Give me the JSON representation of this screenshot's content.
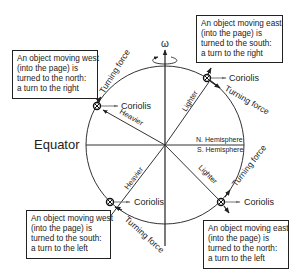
{
  "diagram": {
    "axis_label": "ω",
    "equator_label": "Equator",
    "hemisphere_labels": {
      "north": "N. Hemisphere",
      "south": "S. Hemisphere"
    },
    "markers": [
      {
        "id": "upper-left",
        "coriolis": "Coriolis",
        "turning": "Turning force",
        "radial": "Heavier"
      },
      {
        "id": "upper-right",
        "coriolis": "Coriolis",
        "turning": "Turning force",
        "radial": "Lighter"
      },
      {
        "id": "lower-left",
        "coriolis": "Coriolis",
        "turning": "Turning force",
        "radial": "Heavier"
      },
      {
        "id": "lower-right",
        "coriolis": "Coriolis",
        "turning": "Turning force",
        "radial": "Lighter"
      }
    ],
    "boxes": {
      "upper_left": [
        "An object moving west",
        "(into the page) is",
        "turned to the north:",
        "a turn to the right"
      ],
      "upper_right": [
        "An object moving east",
        "(into the page) is",
        "turned to the south:",
        "a turn to the right"
      ],
      "lower_left": [
        "An object moving west",
        "(into the page) is",
        "turned to the south:",
        "a turn to the left"
      ],
      "lower_right": [
        "An object moving east",
        "(into the page) is",
        "turned to the north:",
        "a turn to the left"
      ]
    }
  }
}
